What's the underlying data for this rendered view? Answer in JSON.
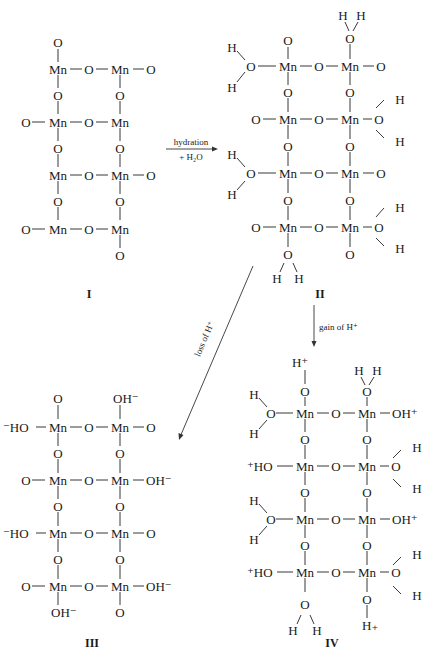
{
  "figure": {
    "structures": [
      {
        "id": "I",
        "label": "I",
        "atoms": {
          "top_left": "O",
          "r1": [
            "",
            "Mn",
            "O",
            "Mn",
            "O"
          ],
          "v1": [
            "O",
            "O"
          ],
          "r2": [
            "O",
            "Mn",
            "O",
            "Mn",
            ""
          ],
          "v2": [
            "O",
            "O"
          ],
          "r3": [
            "",
            "Mn",
            "O",
            "Mn",
            "O"
          ],
          "v3": [
            "O",
            "O"
          ],
          "r4": [
            "O",
            "Mn",
            "O",
            "Mn",
            ""
          ],
          "bottom_right": "O"
        }
      },
      {
        "id": "II",
        "label": "II",
        "atoms": {
          "top_left": "O",
          "top_right": "O",
          "top_right_h": [
            "H",
            "H"
          ],
          "r1": [
            "O",
            "Mn",
            "O",
            "Mn",
            "O"
          ],
          "r1_left_h": [
            "H",
            "H"
          ],
          "v1": [
            "O",
            "O"
          ],
          "r2": [
            "O",
            "Mn",
            "O",
            "Mn",
            "O"
          ],
          "r2_right_h": [
            "H",
            "H"
          ],
          "v2": [
            "O",
            "O"
          ],
          "r3": [
            "O",
            "Mn",
            "O",
            "Mn",
            "O"
          ],
          "r3_left_h": [
            "H",
            "H"
          ],
          "v3": [
            "O",
            "O"
          ],
          "r4": [
            "O",
            "Mn",
            "O",
            "Mn",
            "O"
          ],
          "r4_right_h": [
            "H",
            "H"
          ],
          "bottom_left": "O",
          "bottom_left_h": [
            "H",
            "H"
          ],
          "bottom_right": "O"
        }
      },
      {
        "id": "III",
        "label": "III",
        "atoms": {
          "top_left": "O",
          "top_right": "OH⁻",
          "r1": [
            "⁻HO",
            "Mn",
            "O",
            "Mn",
            "O"
          ],
          "v1": [
            "O",
            "O"
          ],
          "r2": [
            "O",
            "Mn",
            "O",
            "Mn",
            "OH⁻"
          ],
          "v2": [
            "O",
            "O"
          ],
          "r3": [
            "⁻HO",
            "Mn",
            "O",
            "Mn",
            "O"
          ],
          "v3": [
            "O",
            "O"
          ],
          "r4": [
            "O",
            "Mn",
            "O",
            "Mn",
            "OH⁻"
          ],
          "bottom_left": "OH⁻",
          "bottom_right": "O"
        }
      },
      {
        "id": "IV",
        "label": "IV",
        "atoms": {
          "top_left_h": "H⁺",
          "top_left": "O",
          "top_right": "O",
          "top_right_h": [
            "H",
            "H"
          ],
          "r1": [
            "O",
            "Mn",
            "O",
            "Mn",
            "OH⁺"
          ],
          "r1_left_h": [
            "H",
            "H"
          ],
          "v1": [
            "O",
            "O"
          ],
          "r2": [
            "⁺HO",
            "Mn",
            "O",
            "Mn",
            "O"
          ],
          "r2_right_h": [
            "H",
            "H"
          ],
          "v2": [
            "O",
            "O"
          ],
          "r3": [
            "O",
            "Mn",
            "O",
            "Mn",
            "OH⁺"
          ],
          "r3_left_h": [
            "H",
            "H"
          ],
          "v3": [
            "O",
            "O"
          ],
          "r4": [
            "⁺HO",
            "Mn",
            "O",
            "Mn",
            "O"
          ],
          "r4_right_h": [
            "H",
            "H"
          ],
          "bottom_left": "O",
          "bottom_left_h": [
            "H",
            "H"
          ],
          "bottom_right": "O",
          "bottom_right_h": "H₊"
        }
      }
    ],
    "arrows": {
      "hydration": {
        "top": "hydration",
        "bottom": "+ H₂O"
      },
      "gain": {
        "label": "gain of H⁺"
      },
      "loss": {
        "label": "loss of H⁺"
      }
    }
  }
}
